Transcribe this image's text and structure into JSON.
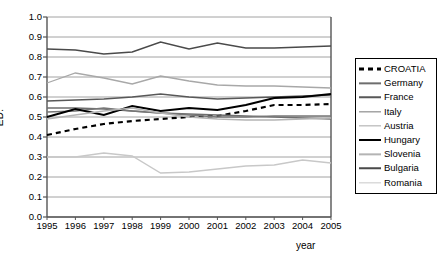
{
  "chart_data": {
    "type": "line",
    "title": "",
    "xlabel": "year",
    "ylabel": "ED.",
    "xlim": [
      1995,
      2005
    ],
    "ylim": [
      0.0,
      1.0
    ],
    "grid": "horizontal",
    "legend_position": "right",
    "x": [
      1995,
      1996,
      1997,
      1998,
      1999,
      2000,
      2001,
      2002,
      2003,
      2004,
      2005
    ],
    "xticklabels": [
      "1995",
      "1996",
      "1997",
      "1998",
      "1999",
      "2000",
      "2001",
      "2002",
      "2003",
      "2004",
      "2005"
    ],
    "yticklabels": [
      "0.0",
      "0.1",
      "0.2",
      "0.3",
      "0.4",
      "0.5",
      "0.6",
      "0.7",
      "0.8",
      "0.9",
      "1.0"
    ],
    "yticks": [
      0.0,
      0.1,
      0.2,
      0.3,
      0.4,
      0.5,
      0.6,
      0.7,
      0.8,
      0.9,
      1.0
    ],
    "series": [
      {
        "name": "CROATIA",
        "color": "#000000",
        "width": 2.2,
        "style": "dashed",
        "values": [
          0.41,
          0.44,
          0.465,
          0.48,
          0.49,
          0.5,
          0.505,
          0.53,
          0.56,
          0.56,
          0.565
        ]
      },
      {
        "name": "Germany",
        "color": "#6e6e6e",
        "width": 1.3,
        "style": "solid",
        "values": [
          0.545,
          0.545,
          0.54,
          0.53,
          0.52,
          0.515,
          0.51,
          0.505,
          0.5,
          0.495,
          0.49
        ]
      },
      {
        "name": "France",
        "color": "#585858",
        "width": 1.5,
        "style": "solid",
        "values": [
          0.58,
          0.585,
          0.59,
          0.6,
          0.615,
          0.6,
          0.59,
          0.595,
          0.6,
          0.605,
          0.61
        ]
      },
      {
        "name": "Italy",
        "color": "#777777",
        "width": 1.3,
        "style": "solid",
        "values": [
          0.525,
          0.53,
          0.545,
          0.53,
          0.52,
          0.51,
          0.5,
          0.5,
          0.505,
          0.505,
          0.505
        ]
      },
      {
        "name": "Austria",
        "color": "#a8a8a8",
        "width": 1.3,
        "style": "solid",
        "values": [
          0.67,
          0.72,
          0.695,
          0.665,
          0.705,
          0.68,
          0.66,
          0.655,
          0.655,
          0.65,
          0.645
        ]
      },
      {
        "name": "Hungary",
        "color": "#000000",
        "width": 2.0,
        "style": "solid",
        "values": [
          0.5,
          0.54,
          0.51,
          0.555,
          0.53,
          0.545,
          0.535,
          0.56,
          0.595,
          0.6,
          0.615
        ]
      },
      {
        "name": "Slovenia",
        "color": "#b4b4b4",
        "width": 1.3,
        "style": "solid",
        "values": [
          0.49,
          0.51,
          0.53,
          0.545,
          0.52,
          0.5,
          0.49,
          0.485,
          0.485,
          0.49,
          0.495
        ]
      },
      {
        "name": "Bulgaria",
        "color": "#4a4a4a",
        "width": 1.5,
        "style": "solid",
        "values": [
          0.84,
          0.835,
          0.815,
          0.825,
          0.875,
          0.84,
          0.87,
          0.845,
          0.845,
          0.85,
          0.855
        ]
      },
      {
        "name": "Romania",
        "color": "#c8c8c8",
        "width": 1.3,
        "style": "solid",
        "values": [
          0.3,
          0.3,
          0.32,
          0.305,
          0.22,
          0.225,
          0.24,
          0.255,
          0.26,
          0.285,
          0.27
        ]
      }
    ]
  },
  "legend": {
    "items": [
      {
        "label": "CROATIA"
      },
      {
        "label": "Germany"
      },
      {
        "label": "France"
      },
      {
        "label": "Italy"
      },
      {
        "label": "Austria"
      },
      {
        "label": "Hungary"
      },
      {
        "label": "Slovenia"
      },
      {
        "label": "Bulgaria"
      },
      {
        "label": "Romania"
      }
    ]
  },
  "axes": {
    "ylabel": "ED.",
    "xlabel": "year"
  }
}
